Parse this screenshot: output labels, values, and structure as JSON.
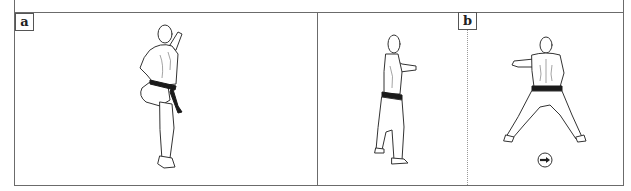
{
  "figure": {
    "panels": [
      {
        "label": "a",
        "description": "kicking stance, rear view, knee raised"
      },
      {
        "label": "b",
        "description": "stance sequence: side view then wide stance rear view"
      }
    ],
    "direction_marker": {
      "icon": "circle-arrow-right-icon",
      "glyph": "→"
    }
  },
  "colors": {
    "border": "#6b6b6b",
    "ink": "#333333",
    "belt": "#1a1a1a"
  }
}
